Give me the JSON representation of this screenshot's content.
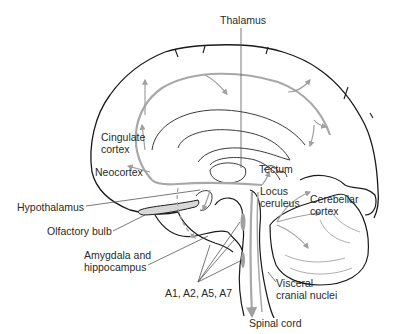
{
  "diagram": {
    "type": "anatomical-diagram",
    "colors": {
      "outline": "#1a1a1a",
      "inner_lines": "#3a3a3a",
      "pathway": "#a0a0a0",
      "leader_lines": "#555555",
      "text": "#2a2a2a",
      "background": "#ffffff"
    },
    "labels": {
      "thalamus": "Thalamus",
      "cingulate_cortex": "Cingulate\ncortex",
      "neocortex": "Neocortex",
      "tectum": "Tectum",
      "locus_ceruleus": "Locus\nceruleus",
      "cerebellar_cortex": "Cerebellar\ncortex",
      "hypothalamus": "Hypothalamus",
      "olfactory_bulb": "Olfactory bulb",
      "amygdala_hippocampus": "Amygdala and\nhippocampus",
      "a_groups": "A1, A2, A5, A7",
      "visceral_cranial_nuclei": "Visceral\ncranial nuclei",
      "spinal_cord": "Spinal cord"
    }
  }
}
